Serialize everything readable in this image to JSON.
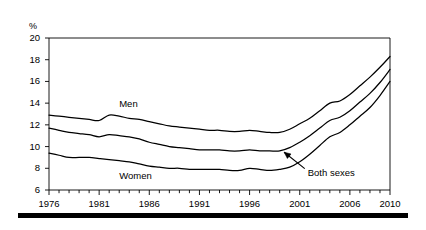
{
  "chart_data": {
    "type": "line",
    "title": "",
    "subtitle": "",
    "xlabel": "",
    "ylabel": "%",
    "yunit": "%",
    "xlim": [
      1976,
      2010
    ],
    "ylim": [
      6,
      20
    ],
    "ytick_step": 2,
    "grid": false,
    "legend_position": "inline-annotations",
    "x": [
      1976,
      1977,
      1978,
      1979,
      1980,
      1981,
      1982,
      1983,
      1984,
      1985,
      1986,
      1987,
      1988,
      1989,
      1990,
      1991,
      1992,
      1993,
      1994,
      1995,
      1996,
      1997,
      1998,
      1999,
      2000,
      2001,
      2002,
      2003,
      2004,
      2005,
      2006,
      2007,
      2008,
      2009,
      2010
    ],
    "yticks": [
      6,
      8,
      10,
      12,
      14,
      16,
      18,
      20
    ],
    "xticks": [
      1976,
      1977,
      1978,
      1979,
      1980,
      1981,
      1982,
      1983,
      1984,
      1985,
      1986,
      1987,
      1988,
      1989,
      1990,
      1991,
      1992,
      1993,
      1994,
      1995,
      1996,
      1997,
      1998,
      1999,
      2000,
      2001,
      2002,
      2003,
      2004,
      2005,
      2006,
      2007,
      2008,
      2009,
      2010
    ],
    "xtick_labels": [
      "1976",
      "1981",
      "1986",
      "1991",
      "1996",
      "2001",
      "2006",
      "2010"
    ],
    "xtick_label_values": [
      1976,
      1981,
      1986,
      1991,
      1996,
      2001,
      2006,
      2010
    ],
    "series": [
      {
        "name": "Men",
        "values": [
          12.9,
          12.8,
          12.7,
          12.6,
          12.5,
          12.4,
          12.9,
          12.8,
          12.6,
          12.5,
          12.3,
          12.1,
          11.9,
          11.8,
          11.7,
          11.6,
          11.5,
          11.5,
          11.4,
          11.4,
          11.5,
          11.4,
          11.3,
          11.3,
          11.6,
          12.1,
          12.6,
          13.3,
          14.0,
          14.2,
          14.8,
          15.6,
          16.4,
          17.3,
          18.3
        ]
      },
      {
        "name": "Both sexes",
        "values": [
          11.7,
          11.5,
          11.3,
          11.2,
          11.1,
          10.9,
          11.1,
          11.0,
          10.9,
          10.7,
          10.4,
          10.2,
          10.0,
          9.9,
          9.8,
          9.7,
          9.7,
          9.7,
          9.6,
          9.6,
          9.7,
          9.6,
          9.6,
          9.6,
          9.9,
          10.4,
          11.0,
          11.7,
          12.4,
          12.7,
          13.3,
          14.1,
          14.9,
          15.9,
          17.1
        ]
      },
      {
        "name": "Women",
        "values": [
          9.4,
          9.2,
          9.0,
          9.0,
          9.0,
          8.9,
          8.8,
          8.7,
          8.6,
          8.4,
          8.2,
          8.1,
          8.0,
          8.0,
          7.9,
          7.9,
          7.9,
          7.9,
          7.8,
          7.8,
          8.0,
          7.9,
          7.8,
          7.9,
          8.1,
          8.6,
          9.3,
          10.1,
          10.9,
          11.3,
          12.0,
          12.8,
          13.6,
          14.7,
          16.0
        ]
      }
    ],
    "annotations": [
      {
        "text": "Men",
        "x": 1983,
        "y": 13.9
      },
      {
        "text": "Women",
        "x": 1983,
        "y": 7.3
      },
      {
        "text": "Both sexes",
        "x": 2001.8,
        "y": 7.6,
        "arrow_to_x": 1999.2,
        "arrow_to_y": 9.8
      }
    ],
    "colors": {
      "line": "#000000",
      "axis": "#000000",
      "background": "#ffffff",
      "rule": "#000000"
    }
  }
}
